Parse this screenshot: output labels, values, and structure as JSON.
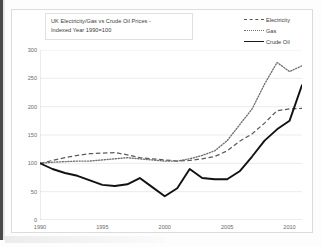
{
  "chart_data": {
    "type": "line",
    "title": "UK Electricity/Gas vs Crude Oil Prices - Indexed Year 1990=100",
    "title_lines": [
      "UK Electricity/Gas vs Crude Oil Prices -",
      "Indexed Year 1990=100"
    ],
    "xlabel": "",
    "ylabel": "",
    "xlim": [
      1990,
      2011
    ],
    "ylim": [
      0,
      300
    ],
    "ytick_interval": 50,
    "yticks": [
      0,
      50,
      100,
      150,
      200,
      250,
      300
    ],
    "ytick_labels": [
      "0",
      "50",
      "100",
      "150",
      "200",
      "250",
      "300"
    ],
    "xticks": [
      1990,
      1995,
      2000,
      2005,
      2010
    ],
    "xtick_labels": [
      "1990",
      "1995",
      "2000",
      "2005",
      "2010"
    ],
    "grid": "horizontal",
    "legend_position": "top-right",
    "x": [
      1990,
      1991,
      1992,
      1993,
      1994,
      1995,
      1996,
      1997,
      1998,
      1999,
      2000,
      2001,
      2002,
      2003,
      2004,
      2005,
      2006,
      2007,
      2008,
      2009,
      2010,
      2011
    ],
    "series": [
      {
        "name": "Electricity",
        "style": "dashed",
        "color": "#5a5a5a",
        "values": [
          100,
          105,
          110,
          114,
          117,
          118,
          119,
          115,
          110,
          108,
          106,
          104,
          105,
          108,
          112,
          122,
          139,
          152,
          171,
          193,
          196,
          197
        ]
      },
      {
        "name": "Gas",
        "style": "dotted",
        "color": "#6e6e6e",
        "values": [
          100,
          102,
          103,
          104,
          104,
          106,
          108,
          110,
          108,
          106,
          104,
          104,
          108,
          114,
          122,
          140,
          168,
          196,
          240,
          278,
          262,
          272
        ]
      },
      {
        "name": "Crude Oil",
        "style": "solid",
        "color": "#111111",
        "values": [
          100,
          90,
          83,
          78,
          70,
          62,
          60,
          63,
          74,
          58,
          42,
          56,
          90,
          74,
          72,
          72,
          86,
          112,
          140,
          160,
          175,
          238
        ]
      }
    ],
    "series_crude_oil_note": "Crude Oil series peaks at 238 in 2008, falls to 142 in 2009, recovers to 220 in 2011"
  },
  "legend": {
    "items": [
      {
        "label": "Electricity",
        "key": "dashed-line-key"
      },
      {
        "label": "Gas",
        "key": "dotted-line-key"
      },
      {
        "label": "Crude Oil",
        "key": "solid-line-key"
      }
    ]
  }
}
